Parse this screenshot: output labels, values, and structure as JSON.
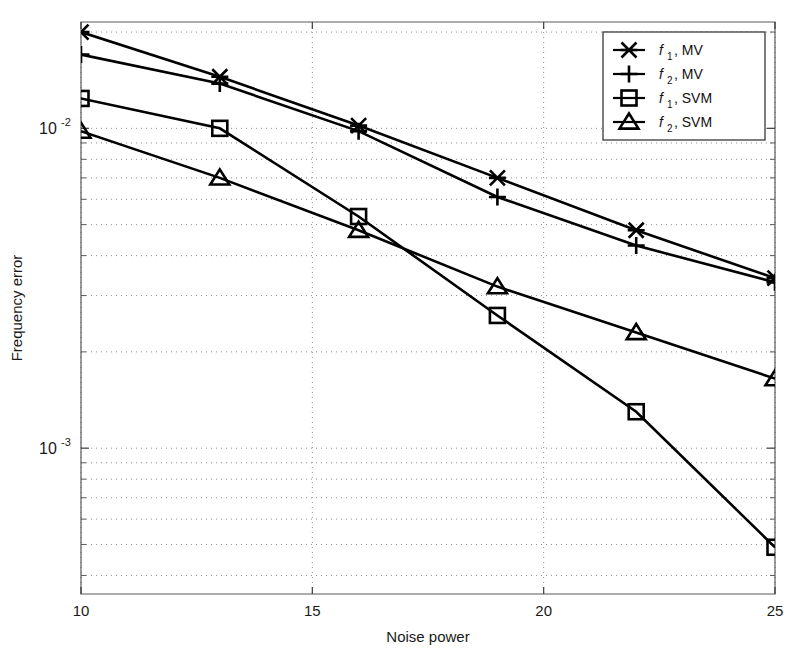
{
  "chart_data": {
    "type": "line",
    "title": "",
    "xlabel": "Noise power",
    "ylabel": "Frequency error",
    "xscale": "linear",
    "yscale": "log",
    "xlim": [
      10,
      25
    ],
    "ylim": [
      0.00035,
      0.0215
    ],
    "xticks": [
      "10",
      "15",
      "20",
      "25"
    ],
    "xtick_values": [
      10,
      15,
      20,
      25
    ],
    "yticks": [
      "10^-2",
      "10^-3"
    ],
    "ytick_values": [
      0.01,
      0.001
    ],
    "ytick_base": "10",
    "ytick_exponents": [
      "-2",
      "-3"
    ],
    "grid": "dotted-minor-and-major",
    "legend_position": "top-right",
    "x": [
      10,
      13,
      16,
      19,
      22,
      25
    ],
    "series": [
      {
        "name": "f1, MV",
        "label_base": "f",
        "label_sub": "1",
        "label_tail": ", MV",
        "marker": "x-cross",
        "color": "#000000",
        "values": [
          0.02,
          0.0145,
          0.0102,
          0.007,
          0.0048,
          0.0034
        ]
      },
      {
        "name": "f2, MV",
        "label_base": "f",
        "label_sub": "2",
        "label_tail": ", MV",
        "marker": "plus",
        "color": "#000000",
        "values": [
          0.017,
          0.0138,
          0.0098,
          0.0061,
          0.0043,
          0.0033
        ]
      },
      {
        "name": "f1, SVM",
        "label_base": "f",
        "label_sub": "1",
        "label_tail": ", SVM",
        "marker": "square",
        "color": "#000000",
        "values": [
          0.0124,
          0.01,
          0.0053,
          0.0026,
          0.0013,
          0.00049
        ]
      },
      {
        "name": "f2, SVM",
        "label_base": "f",
        "label_sub": "2",
        "label_tail": ", SVM",
        "marker": "triangle",
        "color": "#000000",
        "values": [
          0.0098,
          0.007,
          0.0048,
          0.0032,
          0.0023,
          0.00165
        ]
      }
    ]
  },
  "figure": {
    "background": "#ffffff",
    "axis_color": "#5a5a5a",
    "grid_color": "#8e8e8e",
    "series_color": "#000000"
  }
}
